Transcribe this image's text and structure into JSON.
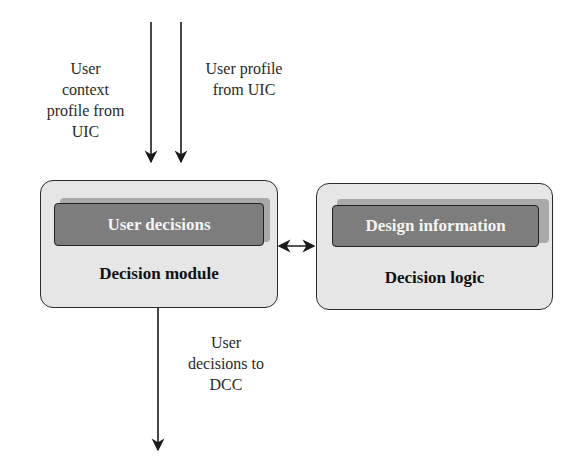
{
  "diagram": {
    "inputs": [
      {
        "id": "user-context-profile",
        "label_lines": [
          "User",
          "context",
          "profile from",
          "UIC"
        ]
      },
      {
        "id": "user-profile",
        "label_lines": [
          "User profile",
          "from UIC"
        ]
      }
    ],
    "output": {
      "id": "user-decisions-out",
      "label_lines": [
        "User",
        "decisions to",
        "DCC"
      ]
    },
    "modules": [
      {
        "id": "decision-module",
        "title": "Decision module",
        "inner_label": "User decisions"
      },
      {
        "id": "decision-logic",
        "title": "Decision logic",
        "inner_label": "Design information"
      }
    ],
    "connections": [
      {
        "from": "external",
        "to": "decision-module",
        "label": "User context profile from UIC",
        "direction": "down"
      },
      {
        "from": "external",
        "to": "decision-module",
        "label": "User profile from UIC",
        "direction": "down"
      },
      {
        "from": "decision-module",
        "to": "decision-logic",
        "label": "",
        "direction": "bidirectional"
      },
      {
        "from": "decision-module",
        "to": "external",
        "label": "User decisions to DCC",
        "direction": "down"
      }
    ],
    "colors": {
      "module_fill": "#e6e6e6",
      "inner_fill": "#7d7d7d",
      "inner_shadow": "#a9a9a9",
      "stroke": "#2b2b2b",
      "inner_text": "#f4f4f4"
    }
  }
}
